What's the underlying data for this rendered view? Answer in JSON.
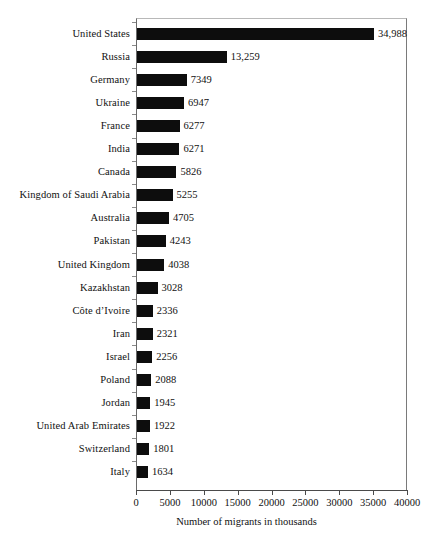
{
  "chart_data": {
    "type": "bar",
    "orientation": "horizontal",
    "title": "",
    "xlabel": "Number of migrants in thousands",
    "ylabel": "",
    "xlim": [
      0,
      40000
    ],
    "xticks": [
      0,
      5000,
      10000,
      15000,
      20000,
      25000,
      30000,
      35000,
      40000
    ],
    "xtick_labels": [
      "0",
      "5000",
      "10000",
      "15000",
      "20000",
      "25000",
      "30000",
      "35000",
      "40000"
    ],
    "grid": false,
    "legend": null,
    "bar_color": "#0d0d0d",
    "categories": [
      "United States",
      "Russia",
      "Germany",
      "Ukraine",
      "France",
      "India",
      "Canada",
      "Kingdom of Saudi Arabia",
      "Australia",
      "Pakistan",
      "United Kingdom",
      "Kazakhstan",
      "Côte d’Ivoire",
      "Iran",
      "Israel",
      "Poland",
      "Jordan",
      "United Arab Emirates",
      "Switzerland",
      "Italy"
    ],
    "values": [
      34988,
      13259,
      7349,
      6947,
      6277,
      6271,
      5826,
      5255,
      4705,
      4243,
      4038,
      3028,
      2336,
      2321,
      2256,
      2088,
      1945,
      1922,
      1801,
      1634
    ],
    "value_labels": [
      "34,988",
      "13,259",
      "7349",
      "6947",
      "6277",
      "6271",
      "5826",
      "5255",
      "4705",
      "4243",
      "4038",
      "3028",
      "2336",
      "2321",
      "2256",
      "2088",
      "1945",
      "1922",
      "1801",
      "1634"
    ]
  }
}
